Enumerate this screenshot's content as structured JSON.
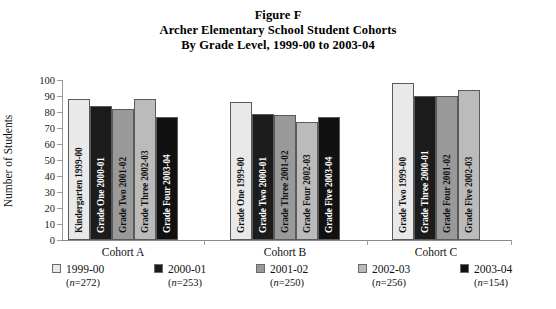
{
  "title": {
    "line1": "Figure F",
    "line2": "Archer Elementary School Student Cohorts",
    "line3": "By Grade Level, 1999-00 to 2003-04"
  },
  "chart_data": {
    "type": "bar",
    "xlabel": "",
    "ylabel": "Number of Students",
    "ylim": [
      0,
      100
    ],
    "yticks": [
      0,
      10,
      20,
      30,
      40,
      50,
      60,
      70,
      80,
      90,
      100
    ],
    "grid": false,
    "legend_position": "bottom",
    "categories": [
      "Cohort A",
      "Cohort B",
      "Cohort C"
    ],
    "series": [
      {
        "name": "1999-00",
        "n": 272,
        "color": "#e9e9e9",
        "values": [
          88,
          86,
          98
        ],
        "bar_labels": [
          "Kindergarten 1999-00",
          "Grade One 1999-00",
          "Grade Two 1999-00"
        ]
      },
      {
        "name": "2000-01",
        "n": 253,
        "color": "#1c1c1c",
        "values": [
          84,
          79,
          90
        ],
        "bar_labels": [
          "Grade One 2000-01",
          "Grade Two 2000-01",
          "Grade Three 2000-01"
        ]
      },
      {
        "name": "2001-02",
        "n": 250,
        "color": "#999999",
        "values": [
          82,
          78,
          90
        ],
        "bar_labels": [
          "Grade Two 2001-02",
          "Grade Three 2001-02",
          "Grade Four 2001-02"
        ]
      },
      {
        "name": "2002-03",
        "n": 256,
        "color": "#bbbbbb",
        "values": [
          88,
          74,
          94
        ],
        "bar_labels": [
          "Grade Three 2002-03",
          "Grade Four 2002-03",
          "Grade Five 2002-03"
        ]
      },
      {
        "name": "2003-04",
        "n": 154,
        "color": "#111111",
        "values": [
          77,
          77,
          null
        ],
        "bar_labels": [
          "Grade Four 2003-04",
          "Grade Five 2003-04",
          null
        ]
      }
    ],
    "bars": [
      {
        "group": "Cohort A",
        "series": "1999-00",
        "label": "Kindergarten 1999-00",
        "value": 88,
        "color": "#e9e9e9",
        "text_color": "#111111"
      },
      {
        "group": "Cohort A",
        "series": "2000-01",
        "label": "Grade One 2000-01",
        "value": 84,
        "color": "#1c1c1c",
        "text_color": "#ffffff"
      },
      {
        "group": "Cohort A",
        "series": "2001-02",
        "label": "Grade Two 2001-02",
        "value": 82,
        "color": "#999999",
        "text_color": "#111111"
      },
      {
        "group": "Cohort A",
        "series": "2002-03",
        "label": "Grade Three 2002-03",
        "value": 88,
        "color": "#bbbbbb",
        "text_color": "#111111"
      },
      {
        "group": "Cohort A",
        "series": "2003-04",
        "label": "Grade Four 2003-04",
        "value": 77,
        "color": "#111111",
        "text_color": "#ffffff"
      },
      {
        "group": "Cohort B",
        "series": "1999-00",
        "label": "Grade One 1999-00",
        "value": 86,
        "color": "#e9e9e9",
        "text_color": "#111111"
      },
      {
        "group": "Cohort B",
        "series": "2000-01",
        "label": "Grade Two 2000-01",
        "value": 79,
        "color": "#1c1c1c",
        "text_color": "#ffffff"
      },
      {
        "group": "Cohort B",
        "series": "2001-02",
        "label": "Grade Three 2001-02",
        "value": 78,
        "color": "#999999",
        "text_color": "#111111"
      },
      {
        "group": "Cohort B",
        "series": "2002-03",
        "label": "Grade Four 2002-03",
        "value": 74,
        "color": "#bbbbbb",
        "text_color": "#111111"
      },
      {
        "group": "Cohort B",
        "series": "2003-04",
        "label": "Grade Five 2003-04",
        "value": 77,
        "color": "#111111",
        "text_color": "#ffffff"
      },
      {
        "group": "Cohort C",
        "series": "1999-00",
        "label": "Grade Two 1999-00",
        "value": 98,
        "color": "#e9e9e9",
        "text_color": "#111111"
      },
      {
        "group": "Cohort C",
        "series": "2000-01",
        "label": "Grade Three 2000-01",
        "value": 90,
        "color": "#1c1c1c",
        "text_color": "#ffffff"
      },
      {
        "group": "Cohort C",
        "series": "2001-02",
        "label": "Grade Four 2001-02",
        "value": 90,
        "color": "#999999",
        "text_color": "#111111"
      },
      {
        "group": "Cohort C",
        "series": "2002-03",
        "label": "Grade Five 2002-03",
        "value": 94,
        "color": "#bbbbbb",
        "text_color": "#111111"
      }
    ]
  },
  "legend": [
    {
      "label": "1999-00",
      "n_text": "n=272",
      "color": "#e9e9e9"
    },
    {
      "label": "2000-01",
      "n_text": "n=253",
      "color": "#1c1c1c"
    },
    {
      "label": "2001-02",
      "n_text": "n=250",
      "color": "#999999"
    },
    {
      "label": "2002-03",
      "n_text": "n=256",
      "color": "#bbbbbb"
    },
    {
      "label": "2003-04",
      "n_text": "n=154",
      "color": "#111111"
    }
  ]
}
